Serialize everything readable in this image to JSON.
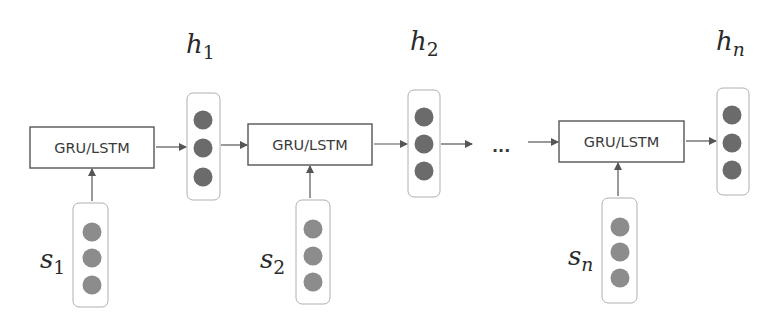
{
  "diagram": {
    "type": "recurrent-network-unrolled",
    "colors": {
      "box_stroke": "#555555",
      "arrow": "#555555",
      "hidden_node_fill": "#6b6b6b",
      "input_node_fill": "#8c8c8c",
      "column_stroke": "#b0b0b0",
      "text": "#333333"
    },
    "cells": [
      {
        "label": "GRU/LSTM",
        "box": {
          "x": 30,
          "y": 127,
          "w": 124,
          "h": 41
        },
        "input": {
          "var": "s",
          "sub": "1",
          "column": {
            "x": 73,
            "y": 203,
            "w": 35,
            "h": 104
          },
          "nodes_cx": 92,
          "nodes_cy": [
            232,
            258,
            285
          ],
          "label_x": 40,
          "label_y": 268
        },
        "hidden": {
          "var": "h",
          "sub": "1",
          "column": {
            "x": 187,
            "y": 93,
            "w": 33,
            "h": 107
          },
          "nodes_cx": 203,
          "nodes_cy": [
            120,
            148,
            177
          ],
          "label_x": 186,
          "label_y": 53
        }
      },
      {
        "label": "GRU/LSTM",
        "box": {
          "x": 248,
          "y": 124,
          "w": 124,
          "h": 41
        },
        "input": {
          "var": "s",
          "sub": "2",
          "column": {
            "x": 296,
            "y": 200,
            "w": 34,
            "h": 104
          },
          "nodes_cx": 313,
          "nodes_cy": [
            229,
            256,
            282
          ],
          "label_x": 260,
          "label_y": 268
        },
        "hidden": {
          "var": "h",
          "sub": "2",
          "column": {
            "x": 408,
            "y": 90,
            "w": 32,
            "h": 107
          },
          "nodes_cx": 424,
          "nodes_cy": [
            117,
            144,
            171
          ],
          "label_x": 410,
          "label_y": 50
        }
      },
      {
        "label": "GRU/LSTM",
        "box": {
          "x": 559,
          "y": 121,
          "w": 125,
          "h": 41
        },
        "input": {
          "var": "s",
          "sub": "n",
          "column": {
            "x": 602,
            "y": 198,
            "w": 35,
            "h": 105
          },
          "nodes_cx": 620,
          "nodes_cy": [
            227,
            252,
            278
          ],
          "label_x": 568,
          "label_y": 265
        },
        "hidden": {
          "var": "h",
          "sub": "n",
          "column": {
            "x": 717,
            "y": 88,
            "w": 32,
            "h": 107
          },
          "nodes_cx": 732,
          "nodes_cy": [
            115,
            143,
            170
          ],
          "label_x": 716,
          "label_y": 50
        }
      }
    ],
    "ellipsis": {
      "text": "...",
      "x": 492,
      "y": 152
    },
    "horizontal_arrows": [
      {
        "x1": 156,
        "y1": 147,
        "x2": 186,
        "y2": 147
      },
      {
        "x1": 221,
        "y1": 145,
        "x2": 247,
        "y2": 145
      },
      {
        "x1": 374,
        "y1": 144,
        "x2": 407,
        "y2": 144
      },
      {
        "x1": 441,
        "y1": 144,
        "x2": 472,
        "y2": 144
      },
      {
        "x1": 528,
        "y1": 142,
        "x2": 558,
        "y2": 142
      },
      {
        "x1": 686,
        "y1": 141,
        "x2": 716,
        "y2": 141
      }
    ],
    "vertical_arrows": [
      {
        "x": 92,
        "y1": 201,
        "y2": 169
      },
      {
        "x": 310,
        "y1": 198,
        "y2": 166
      },
      {
        "x": 618,
        "y1": 196,
        "y2": 163
      }
    ]
  }
}
